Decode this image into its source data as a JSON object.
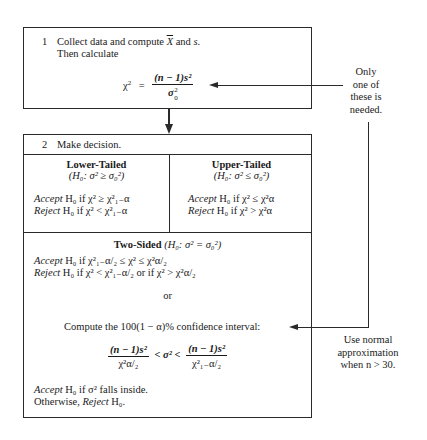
{
  "step1": {
    "number": "1",
    "line1_a": "Collect data and compute ",
    "xbar": "X",
    "line1_b": " and ",
    "s": "s",
    "line1_c": ".",
    "line2": "Then calculate",
    "formula": {
      "lhs": "χ",
      "lhs_sup": "2",
      "eq": "=",
      "numerator": "(n − 1)s²",
      "denominator_sym": "σ",
      "denominator_sup": "2",
      "denominator_sub": "0"
    }
  },
  "step2": {
    "number": "2",
    "header": "Make decision.",
    "lower": {
      "title": "Lower-Tailed",
      "hyp": "(H₀: σ² ≥ σ₀²)",
      "accept_label": "Accept",
      "accept_rest": "H₀ if χ² ≥ χ²₁₋α",
      "reject_label": "Reject",
      "reject_rest": "H₀ if χ² < χ²₁₋α"
    },
    "upper": {
      "title": "Upper-Tailed",
      "hyp": "(H₀: σ² ≤ σ₀²)",
      "accept_label": "Accept",
      "accept_rest": "H₀ if χ² ≤ χ²α",
      "reject_label": "Reject",
      "reject_rest": "H₀ if χ² > χ²α"
    },
    "two_sided": {
      "title": "Two-Sided",
      "hyp": "(H₀: σ² = σ₀²)",
      "accept_label": "Accept",
      "accept_rest": "H₀ if χ²₁₋α/₂ ≤ χ² ≤ χ²α/₂",
      "reject_label": "Reject",
      "reject_rest": "H₀ if χ² < χ²₁₋α/₂  or  if χ² > χ²α/₂",
      "or": "or",
      "ci_text": "Compute the 100(1 − α)% confidence interval:",
      "ci_left_num": "(n − 1)s²",
      "ci_left_den": "χ²α/₂",
      "ci_mid": "< σ² <",
      "ci_right_num": "(n − 1)s²",
      "ci_right_den": "χ²₁₋α/₂",
      "final_accept_label": "Accept",
      "final_accept_rest": "H₀ if σ² falls inside.",
      "final_otherwise": "Otherwise, ",
      "final_reject_label": "Reject",
      "final_reject_rest": "H₀."
    }
  },
  "notes": {
    "only_one": [
      "Only",
      "one of",
      "these is",
      "needed."
    ],
    "normal_approx": [
      "Use normal",
      "approximation",
      "when n > 30."
    ]
  }
}
